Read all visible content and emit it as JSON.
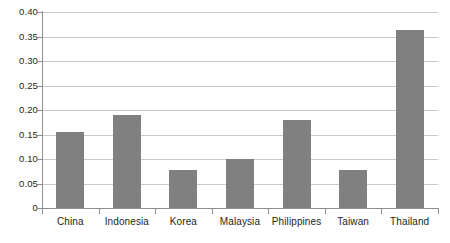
{
  "chart_data": {
    "type": "bar",
    "title": "",
    "subtitle": "",
    "xlabel": "",
    "ylabel": "",
    "categories": [
      "China",
      "Indonesia",
      "Korea",
      "Malaysia",
      "Philippines",
      "Taiwan",
      "Thailand"
    ],
    "values": [
      0.155,
      0.19,
      0.078,
      0.1,
      0.18,
      0.078,
      0.363
    ],
    "ylim": [
      0,
      0.4
    ],
    "ytick_values": [
      0,
      0.05,
      0.1,
      0.15,
      0.2,
      0.25,
      0.3,
      0.35,
      0.4
    ],
    "ytick_labels": [
      "0",
      "0.05",
      "0.10",
      "0.15",
      "0.20",
      "0.25",
      "0.30",
      "0.35",
      "0.40"
    ],
    "grid": true,
    "grid_axis": "y",
    "legend": false,
    "legend_position": "none",
    "annotations": [],
    "colors": {
      "bar_fill": "#808080",
      "gridline": "#c9c9c9",
      "axis_line": "#8d8d8d",
      "text": "#231f20",
      "background": "#ffffff"
    }
  }
}
